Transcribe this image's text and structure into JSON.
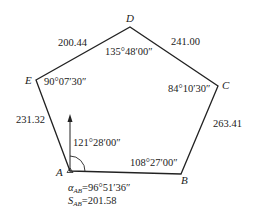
{
  "diagram": {
    "type": "closed traverse (pentagon)",
    "points": {
      "A": {
        "label": "A"
      },
      "B": {
        "label": "B"
      },
      "C": {
        "label": "C"
      },
      "D": {
        "label": "D"
      },
      "E": {
        "label": "E"
      }
    },
    "sides": {
      "AB": "",
      "BC": "263.41",
      "CD": "241.00",
      "DE": "200.44",
      "EA": "231.32"
    },
    "angles": {
      "A": "121°28′00″",
      "B": "108°27′00″",
      "C": "84°10′30″",
      "D": "135°48′00″",
      "E": "90°07′30″"
    },
    "known": {
      "azimuth_symbol": "α",
      "azimuth_sub": "AB",
      "azimuth_value": "=96°51′36″",
      "distance_symbol": "S",
      "distance_sub": "AB",
      "distance_value": "=201.58"
    },
    "colors": {
      "line": "#222222",
      "text": "#222222"
    }
  }
}
